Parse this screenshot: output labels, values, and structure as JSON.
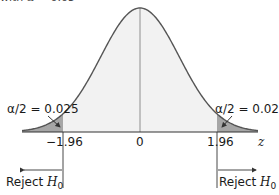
{
  "caption": {
    "prefix": "with ",
    "alpha_symbol": "α",
    "suffix": " = 0.05"
  },
  "colors": {
    "curve": "#555555",
    "center_fill": "#f2f2f2",
    "tail_fill": "#a6a6a6",
    "axis": "#333333"
  },
  "labels": {
    "left_tail": "α/2 = 0.025",
    "right_tail": "α/2 = 0.025",
    "tick_left": "−1.96",
    "tick_center": "0",
    "tick_right": "1.96",
    "axis_var": "z",
    "reject_text": "Reject ",
    "reject_h": "H",
    "reject_sub": "0"
  },
  "chart_data": {
    "type": "area",
    "distribution": "standard normal",
    "xlabel": "z",
    "ylabel": "",
    "x_ticks": [
      -1.96,
      0,
      1.96
    ],
    "x_tick_labels": [
      "−1.96",
      "0",
      "1.96"
    ],
    "critical_values": [
      -1.96,
      1.96
    ],
    "alpha": 0.05,
    "tail_areas": [
      {
        "region": "z < -1.96",
        "area": 0.025,
        "label": "α/2 = 0.025"
      },
      {
        "region": "z > 1.96",
        "area": 0.025,
        "label": "α/2 = 0.025"
      }
    ],
    "rejection_regions": [
      {
        "label": "Reject H0",
        "direction": "left",
        "from": -1.96
      },
      {
        "label": "Reject H0",
        "direction": "right",
        "from": 1.96
      }
    ],
    "grid": false,
    "legend": "none"
  }
}
